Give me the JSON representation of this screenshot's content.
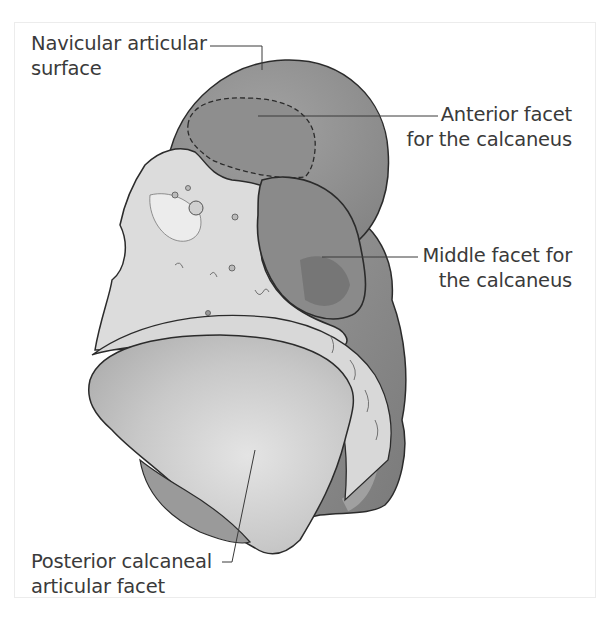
{
  "figure": {
    "labels": {
      "navicular": {
        "line1": "Navicular articular",
        "line2": "surface"
      },
      "anterior": {
        "line1": "Anterior facet",
        "line2": "for the calcaneus"
      },
      "middle": {
        "line1": "Middle facet for",
        "line2": "the calcaneus"
      },
      "posterior": {
        "line1": "Posterior calcaneal",
        "line2": "articular facet"
      }
    },
    "colors": {
      "outline": "#2b2b2b",
      "head_dark": "#8a8a8a",
      "head_mid": "#999999",
      "facet_dark": "#7c7c7c",
      "bone_light": "#dcdcdc",
      "bone_lighter": "#ececec",
      "posterior_facet": "#c4c4c4",
      "text": "#3a3a3a",
      "frame": "#ececec"
    }
  }
}
